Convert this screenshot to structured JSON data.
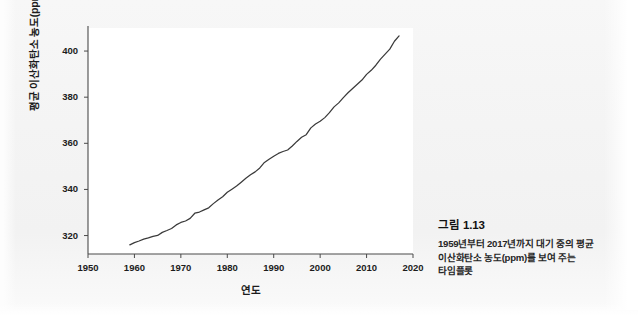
{
  "figure": {
    "caption_number": "그림 1.13",
    "caption_text": "1959년부터 2017년까지 대기 중의 평균 이산화탄소 농도(ppm)를 보여 주는 타임플롯"
  },
  "chart_data": {
    "type": "line",
    "title": "",
    "xlabel": "연도",
    "ylabel": "평균 이산화탄소 농도(ppm)",
    "xlim": [
      1950,
      2020
    ],
    "ylim": [
      312,
      410
    ],
    "xticks": [
      1950,
      1960,
      1970,
      1980,
      1990,
      2000,
      2010,
      2020
    ],
    "xtick_labels": [
      "1950",
      "1960",
      "1970",
      "1980",
      "1990",
      "2000",
      "2010",
      "2020"
    ],
    "yticks": [
      320,
      340,
      360,
      380,
      400
    ],
    "ytick_labels": [
      "320",
      "340",
      "360",
      "380",
      "400"
    ],
    "grid": false,
    "legend": false,
    "line_color": "#3a3a3a",
    "x": [
      1959,
      1960,
      1961,
      1962,
      1963,
      1964,
      1965,
      1966,
      1967,
      1968,
      1969,
      1970,
      1971,
      1972,
      1973,
      1974,
      1975,
      1976,
      1977,
      1978,
      1979,
      1980,
      1981,
      1982,
      1983,
      1984,
      1985,
      1986,
      1987,
      1988,
      1989,
      1990,
      1991,
      1992,
      1993,
      1994,
      1995,
      1996,
      1997,
      1998,
      1999,
      2000,
      2001,
      2002,
      2003,
      2004,
      2005,
      2006,
      2007,
      2008,
      2009,
      2010,
      2011,
      2012,
      2013,
      2014,
      2015,
      2016,
      2017
    ],
    "y": [
      315.98,
      316.91,
      317.64,
      318.45,
      318.99,
      319.62,
      320.04,
      321.37,
      322.18,
      323.05,
      324.62,
      325.68,
      326.32,
      327.46,
      329.68,
      330.19,
      331.12,
      332.03,
      333.84,
      335.41,
      336.84,
      338.76,
      340.12,
      341.48,
      343.15,
      344.85,
      346.35,
      347.61,
      349.31,
      351.69,
      353.1,
      354.39,
      355.61,
      356.45,
      357.1,
      358.83,
      360.82,
      362.61,
      363.73,
      366.7,
      368.38,
      369.55,
      371.14,
      373.28,
      375.8,
      377.52,
      379.8,
      381.9,
      383.79,
      385.6,
      387.43,
      389.9,
      391.65,
      393.85,
      396.52,
      398.65,
      400.83,
      404.24,
      406.55
    ]
  }
}
